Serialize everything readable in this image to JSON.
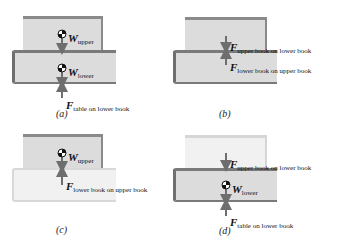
{
  "panels": [
    {
      "id": "a",
      "caption": "(a)",
      "labels": {
        "w_upper": {
          "symbol": "W",
          "subscript": "upper"
        },
        "w_lower": {
          "symbol": "W",
          "subscript": "lower"
        },
        "f_table": {
          "symbol": "F",
          "subscript": "table on lower book"
        }
      }
    },
    {
      "id": "b",
      "caption": "(b)",
      "labels": {
        "f_upper_on_lower": {
          "symbol": "F",
          "subscript": "upper book on lower book"
        },
        "f_lower_on_upper": {
          "symbol": "F",
          "subscript": "lower book on upper book"
        }
      }
    },
    {
      "id": "c",
      "caption": "(c)",
      "labels": {
        "w_upper": {
          "symbol": "W",
          "subscript": "upper"
        },
        "f_lower_on_upper": {
          "symbol": "F",
          "subscript": "lower book on upper book"
        }
      }
    },
    {
      "id": "d",
      "caption": "(d)",
      "labels": {
        "f_upper_on_lower": {
          "symbol": "F",
          "subscript": "upper book on lower book"
        },
        "w_lower": {
          "symbol": "W",
          "subscript": "lower"
        },
        "f_table": {
          "symbol": "F",
          "subscript": "table on lower book"
        }
      }
    }
  ],
  "colors": {
    "book_fill": "#dcdcdc",
    "book_edge": "#7a7a7a",
    "arrow": "#6e6e6e",
    "text": "#111111"
  }
}
